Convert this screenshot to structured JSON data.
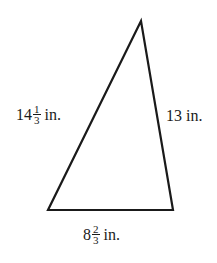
{
  "figure": {
    "type": "triangle",
    "stroke_color": "#1a1a1a",
    "vertices": {
      "apex": [
        141,
        21
      ],
      "bottom_left": [
        48,
        210
      ],
      "bottom_right": [
        173,
        210
      ]
    }
  },
  "sides": {
    "left": {
      "whole": "14",
      "numerator": "1",
      "denominator": "3",
      "unit": "in.",
      "value_text": "14 1/3 in."
    },
    "right": {
      "whole": "13",
      "unit": "in.",
      "value_text": "13 in."
    },
    "bottom": {
      "whole": "8",
      "numerator": "2",
      "denominator": "3",
      "unit": "in.",
      "value_text": "8 2/3 in."
    }
  }
}
